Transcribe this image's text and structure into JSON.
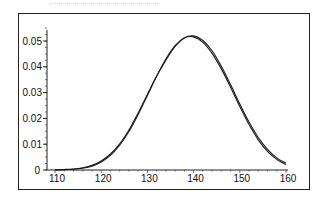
{
  "header": {
    "partial_text": ""
  },
  "chart_data": {
    "type": "line",
    "title": "",
    "xlabel": "",
    "ylabel": "",
    "xlim": [
      110,
      160
    ],
    "ylim": [
      0,
      0.055
    ],
    "grid": false,
    "legend": null,
    "x_ticks": [
      "110",
      "120",
      "130",
      "140",
      "150",
      "160"
    ],
    "y_ticks": [
      "0",
      "0.01",
      "0.02",
      "0.03",
      "0.04",
      "0.05"
    ],
    "x": [
      110,
      112,
      114,
      116,
      118,
      120,
      122,
      124,
      126,
      128,
      130,
      132,
      134,
      136,
      138,
      140,
      142,
      144,
      146,
      148,
      150,
      152,
      154,
      156,
      158,
      160
    ],
    "series": [
      {
        "name": "curve-1",
        "values": [
          0.0001,
          0.0002,
          0.0004,
          0.0009,
          0.0018,
          0.0035,
          0.0062,
          0.0101,
          0.0155,
          0.0221,
          0.0293,
          0.0364,
          0.0426,
          0.0479,
          0.0512,
          0.0516,
          0.0495,
          0.0452,
          0.0392,
          0.0321,
          0.0246,
          0.0176,
          0.0117,
          0.0072,
          0.0041,
          0.0021
        ]
      },
      {
        "name": "curve-2",
        "values": [
          0.0,
          0.0001,
          0.0003,
          0.0007,
          0.0015,
          0.0031,
          0.0057,
          0.0096,
          0.0149,
          0.0215,
          0.0289,
          0.0363,
          0.043,
          0.0482,
          0.0513,
          0.052,
          0.0502,
          0.0462,
          0.0402,
          0.0331,
          0.0256,
          0.0186,
          0.0126,
          0.008,
          0.0047,
          0.0026
        ]
      }
    ]
  }
}
